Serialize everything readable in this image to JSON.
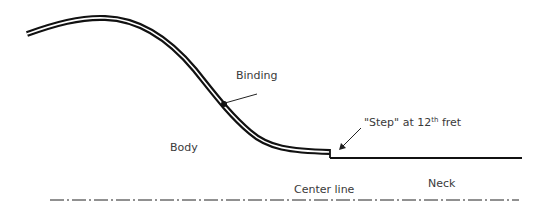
{
  "diagram": {
    "labels": {
      "binding": "Binding",
      "body": "Body",
      "step_prefix": "\"Step\" at 12",
      "step_sup": "th",
      "step_suffix": " fret",
      "center_line": "Center line",
      "neck": "Neck"
    },
    "colors": {
      "line": "#111111",
      "text": "#3a3a3a",
      "background": "#ffffff"
    }
  }
}
